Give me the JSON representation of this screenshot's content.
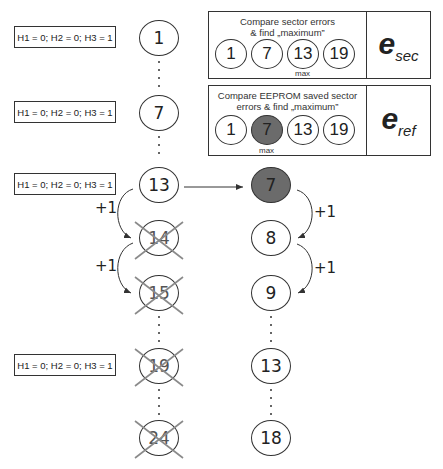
{
  "hamming_label": "H1 = 0; H2 = 0; H3 = 1",
  "left_column": {
    "nodes": [
      {
        "value": "1",
        "crossed": false
      },
      {
        "value": "7",
        "crossed": false
      },
      {
        "value": "13",
        "crossed": false
      },
      {
        "value": "14",
        "crossed": true
      },
      {
        "value": "15",
        "crossed": true
      },
      {
        "value": "19",
        "crossed": true
      },
      {
        "value": "24",
        "crossed": true
      }
    ],
    "increments": [
      "+1",
      "+1"
    ]
  },
  "right_column": {
    "nodes": [
      {
        "value": "7",
        "highlighted": true
      },
      {
        "value": "8"
      },
      {
        "value": "9"
      },
      {
        "value": "13"
      },
      {
        "value": "18"
      }
    ],
    "increments": [
      "+1",
      "+1"
    ]
  },
  "panel_sec": {
    "title_line1": "Compare sector errors",
    "title_line2": "& find „maximum”",
    "values": [
      "1",
      "7",
      "13",
      "19"
    ],
    "max_label": "max",
    "max_index": 2,
    "symbol": "e",
    "subscript": "sec"
  },
  "panel_ref": {
    "title_line1": "Compare EEPROM saved sector",
    "title_line2": "errors & find „maximum”",
    "values": [
      "1",
      "7",
      "13",
      "19"
    ],
    "max_label": "max",
    "max_index": 1,
    "symbol": "e",
    "subscript": "ref"
  },
  "colors": {
    "highlight_fill": "#6b6b6b",
    "cross": "#8a8a8a",
    "stroke": "#333333"
  }
}
